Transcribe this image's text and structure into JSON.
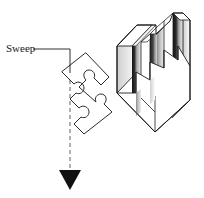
{
  "figure": {
    "name": "sweep-extrusion-diagram",
    "background_color": "#ffffff",
    "stroke_color": "#1a1a1a",
    "annotation": {
      "label": "Sweep",
      "label_x": 6,
      "label_y": 52,
      "leader": {
        "points": "33,49 70,49 70,73",
        "stroke_width": 0.9
      }
    },
    "sweep_path": {
      "name": "sweep-direction-axis",
      "dashed_line": {
        "x": 70,
        "y_start": 66,
        "y_end": 171,
        "dash": "4,3",
        "color": "#6e6e6e",
        "stroke_width": 1.1
      },
      "arrow_head": {
        "points": "59,170 81,170 70,190",
        "fill": "#111111"
      }
    },
    "profile": {
      "name": "puzzle-piece-profile",
      "description": "2D jigsaw puzzle piece outline rotated about 45 degrees",
      "fill": "#ffffff",
      "stroke": "#2b2b2b",
      "stroke_width": 1.0,
      "path": "M 62,72 L 74,84 C 78,80 84,83 84,88 C 84,92 80,95 76,93 L 70,99 L 79,108 C 83,104 89,107 89,112 C 89,116 85,119 81,117 L 74,124 L 84,134 L 112,112 L 104,104 C 108,100 106,94 101,94 C 97,94 94,98 96,102 L 88,96 L 79,87 L 86,80 C 82,76 84,70 89,70 C 93,70 96,74 94,78 L 101,85 L 109,77 L 86,53 Z"
    },
    "solid": {
      "name": "extruded-puzzle-solid",
      "description": "Isometric 3D block formed by sweeping the puzzle profile",
      "shading": {
        "top_face": "#ffffff",
        "front_face": "#ffffff",
        "side_face_light": "#d9d9d9",
        "side_face_mid": "#9a9a9a",
        "side_face_dark": "#2e2e2e",
        "gradient_band": "#6b6b6b"
      },
      "outline_stroke": "#1f1f1f",
      "outline_stroke_width": 0.9
    }
  }
}
